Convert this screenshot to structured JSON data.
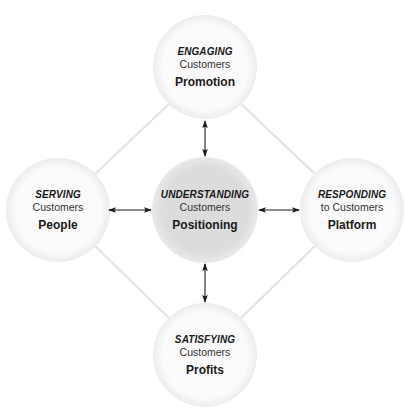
{
  "colors": {
    "background": "#ffffff",
    "outer_circle_fill": "#fbfbfb",
    "outer_circle_glow": "#e4e4e4",
    "center_circle_fill": "#dedede",
    "diamond_line": "#e6e6e6",
    "arrow": "#1a1a1a"
  },
  "nodes": {
    "top": {
      "verb": "ENGAGING",
      "sub": "Customers",
      "key": "Promotion"
    },
    "left": {
      "verb": "SERVING",
      "sub": "Customers",
      "key": "People"
    },
    "center": {
      "verb": "UNDERSTANDING",
      "sub": "Customers",
      "key": "Positioning"
    },
    "right": {
      "verb": "RESPONDING",
      "sub": "to Customers",
      "key": "Platform"
    },
    "bottom": {
      "verb": "SATISFYING",
      "sub": "Customers",
      "key": "Profits"
    }
  },
  "connections": [
    {
      "from": "center",
      "to": "top",
      "type": "double-arrow"
    },
    {
      "from": "center",
      "to": "left",
      "type": "double-arrow"
    },
    {
      "from": "center",
      "to": "right",
      "type": "double-arrow"
    },
    {
      "from": "center",
      "to": "bottom",
      "type": "double-arrow"
    },
    {
      "from": "top",
      "to": "left",
      "type": "line"
    },
    {
      "from": "top",
      "to": "right",
      "type": "line"
    },
    {
      "from": "bottom",
      "to": "left",
      "type": "line"
    },
    {
      "from": "bottom",
      "to": "right",
      "type": "line"
    }
  ]
}
